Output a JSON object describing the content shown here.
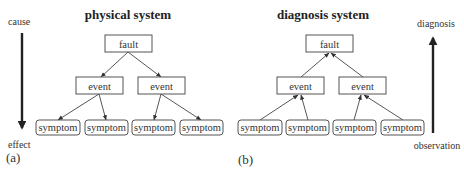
{
  "diagrams": [
    {
      "id": "a",
      "panel_label": "(a)",
      "title": "physical system",
      "direction": "top-down (cause → effect)",
      "axis": {
        "top_label": "cause",
        "bottom_label": "effect",
        "arrow": "down"
      },
      "nodes": {
        "fault": "fault",
        "events": [
          "event",
          "event"
        ],
        "symptoms": [
          "symptom",
          "symptom",
          "symptom",
          "symptom"
        ]
      },
      "edges": [
        [
          "fault",
          "event-1"
        ],
        [
          "fault",
          "event-2"
        ],
        [
          "event-1",
          "symptom-1"
        ],
        [
          "event-1",
          "symptom-2"
        ],
        [
          "event-2",
          "symptom-3"
        ],
        [
          "event-2",
          "symptom-4"
        ]
      ]
    },
    {
      "id": "b",
      "panel_label": "(b)",
      "title": "diagnosis system",
      "direction": "bottom-up (observation → diagnosis)",
      "axis": {
        "top_label": "diagnosis",
        "bottom_label": "observation",
        "arrow": "up"
      },
      "nodes": {
        "fault": "fault",
        "events": [
          "event",
          "event"
        ],
        "symptoms": [
          "symptom",
          "symptom",
          "symptom",
          "symptom"
        ]
      },
      "edges": [
        [
          "event-1",
          "fault"
        ],
        [
          "event-2",
          "fault"
        ],
        [
          "symptom-1",
          "event-1"
        ],
        [
          "symptom-2",
          "event-1"
        ],
        [
          "symptom-3",
          "event-2"
        ],
        [
          "symptom-4",
          "event-2"
        ]
      ]
    }
  ]
}
